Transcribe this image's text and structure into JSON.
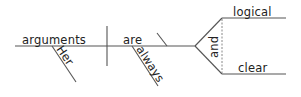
{
  "diagram": {
    "type": "sentence-diagram",
    "sentence": "Her arguments are always logical and clear",
    "colors": {
      "line": "#555555",
      "text": "#222222",
      "dashed": "#888888",
      "background": "#ffffff"
    },
    "subject": {
      "word": "arguments",
      "modifier": "Her"
    },
    "verb": {
      "word": "are",
      "modifier": "always"
    },
    "complement": {
      "conjunction": "and",
      "items": [
        {
          "word": "logical"
        },
        {
          "word": "clear"
        }
      ]
    }
  }
}
